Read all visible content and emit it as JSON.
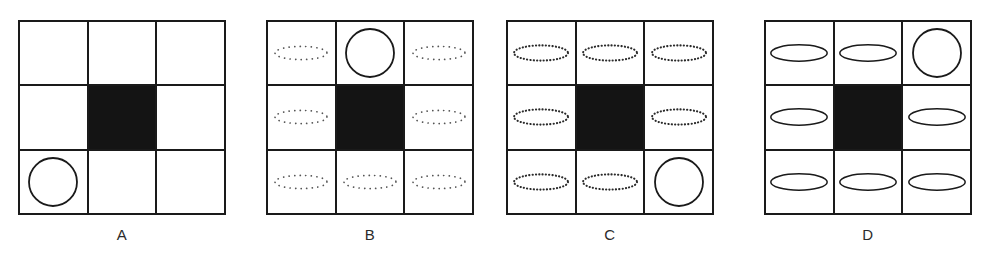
{
  "figure": {
    "caption_style": "multiple-choice-option-panels",
    "panel_count": 4,
    "grid_rows": 3,
    "grid_cols": 3,
    "colors": {
      "stroke": "#1a1a1a",
      "fill_black": "#141414",
      "background": "#ffffff",
      "label_text": "#2b2b2b"
    },
    "panels": [
      {
        "id": "A",
        "label": "A",
        "left": 18,
        "width": 208,
        "height": 195,
        "label_left": 18,
        "label_width": 208,
        "filled_cell_index": 4,
        "cells": [
          {
            "index": 0,
            "row": 0,
            "col": 0,
            "fill": "white",
            "shape": "none"
          },
          {
            "index": 1,
            "row": 0,
            "col": 1,
            "fill": "white",
            "shape": "none"
          },
          {
            "index": 2,
            "row": 0,
            "col": 2,
            "fill": "white",
            "shape": "none"
          },
          {
            "index": 3,
            "row": 1,
            "col": 0,
            "fill": "white",
            "shape": "none"
          },
          {
            "index": 4,
            "row": 1,
            "col": 1,
            "fill": "black",
            "shape": "none"
          },
          {
            "index": 5,
            "row": 1,
            "col": 2,
            "fill": "white",
            "shape": "none"
          },
          {
            "index": 6,
            "row": 2,
            "col": 0,
            "fill": "white",
            "shape": "circle-solid"
          },
          {
            "index": 7,
            "row": 2,
            "col": 1,
            "fill": "white",
            "shape": "none"
          },
          {
            "index": 8,
            "row": 2,
            "col": 2,
            "fill": "white",
            "shape": "none"
          }
        ]
      },
      {
        "id": "B",
        "label": "B",
        "left": 266,
        "width": 208,
        "height": 195,
        "label_left": 266,
        "label_width": 208,
        "filled_cell_index": 4,
        "cells": [
          {
            "index": 0,
            "row": 0,
            "col": 0,
            "fill": "white",
            "shape": "ellipse-dotted-faint"
          },
          {
            "index": 1,
            "row": 0,
            "col": 1,
            "fill": "white",
            "shape": "circle-solid"
          },
          {
            "index": 2,
            "row": 0,
            "col": 2,
            "fill": "white",
            "shape": "ellipse-dotted-faint"
          },
          {
            "index": 3,
            "row": 1,
            "col": 0,
            "fill": "white",
            "shape": "ellipse-dotted-faint"
          },
          {
            "index": 4,
            "row": 1,
            "col": 1,
            "fill": "black",
            "shape": "none"
          },
          {
            "index": 5,
            "row": 1,
            "col": 2,
            "fill": "white",
            "shape": "ellipse-dotted-faint"
          },
          {
            "index": 6,
            "row": 2,
            "col": 0,
            "fill": "white",
            "shape": "ellipse-dotted-faint"
          },
          {
            "index": 7,
            "row": 2,
            "col": 1,
            "fill": "white",
            "shape": "ellipse-dotted-faint"
          },
          {
            "index": 8,
            "row": 2,
            "col": 2,
            "fill": "white",
            "shape": "ellipse-dotted-faint"
          }
        ]
      },
      {
        "id": "C",
        "label": "C",
        "left": 506,
        "width": 208,
        "height": 195,
        "label_left": 506,
        "label_width": 208,
        "filled_cell_index": 4,
        "cells": [
          {
            "index": 0,
            "row": 0,
            "col": 0,
            "fill": "white",
            "shape": "ellipse-dotted-dense"
          },
          {
            "index": 1,
            "row": 0,
            "col": 1,
            "fill": "white",
            "shape": "ellipse-dotted-dense"
          },
          {
            "index": 2,
            "row": 0,
            "col": 2,
            "fill": "white",
            "shape": "ellipse-dotted-dense"
          },
          {
            "index": 3,
            "row": 1,
            "col": 0,
            "fill": "white",
            "shape": "ellipse-dotted-dense"
          },
          {
            "index": 4,
            "row": 1,
            "col": 1,
            "fill": "black",
            "shape": "none"
          },
          {
            "index": 5,
            "row": 1,
            "col": 2,
            "fill": "white",
            "shape": "ellipse-dotted-dense"
          },
          {
            "index": 6,
            "row": 2,
            "col": 0,
            "fill": "white",
            "shape": "ellipse-dotted-dense"
          },
          {
            "index": 7,
            "row": 2,
            "col": 1,
            "fill": "white",
            "shape": "ellipse-dotted-dense"
          },
          {
            "index": 8,
            "row": 2,
            "col": 2,
            "fill": "white",
            "shape": "circle-solid"
          }
        ]
      },
      {
        "id": "D",
        "label": "D",
        "left": 764,
        "width": 208,
        "height": 195,
        "label_left": 764,
        "label_width": 208,
        "filled_cell_index": 4,
        "cells": [
          {
            "index": 0,
            "row": 0,
            "col": 0,
            "fill": "white",
            "shape": "ellipse-solid"
          },
          {
            "index": 1,
            "row": 0,
            "col": 1,
            "fill": "white",
            "shape": "ellipse-solid"
          },
          {
            "index": 2,
            "row": 0,
            "col": 2,
            "fill": "white",
            "shape": "circle-solid"
          },
          {
            "index": 3,
            "row": 1,
            "col": 0,
            "fill": "white",
            "shape": "ellipse-solid"
          },
          {
            "index": 4,
            "row": 1,
            "col": 1,
            "fill": "black",
            "shape": "none"
          },
          {
            "index": 5,
            "row": 1,
            "col": 2,
            "fill": "white",
            "shape": "ellipse-solid"
          },
          {
            "index": 6,
            "row": 2,
            "col": 0,
            "fill": "white",
            "shape": "ellipse-solid"
          },
          {
            "index": 7,
            "row": 2,
            "col": 1,
            "fill": "white",
            "shape": "ellipse-solid"
          },
          {
            "index": 8,
            "row": 2,
            "col": 2,
            "fill": "white",
            "shape": "ellipse-solid"
          }
        ]
      }
    ]
  }
}
